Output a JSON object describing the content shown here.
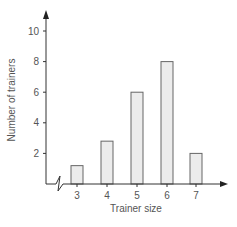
{
  "chart_data": {
    "type": "bar",
    "title": "",
    "xlabel": "Trainer size",
    "ylabel": "Number of trainers",
    "categories": [
      "3",
      "4",
      "5",
      "6",
      "7"
    ],
    "values": [
      1.2,
      2.8,
      6,
      8,
      2
    ],
    "yticks": [
      "2",
      "4",
      "6",
      "8",
      "10"
    ],
    "ylim": [
      0,
      11
    ],
    "grid": false,
    "legend": null,
    "axis_break": true,
    "bar_fill": "#ececec",
    "bar_stroke": "#666666",
    "axis_color": "#333333"
  }
}
